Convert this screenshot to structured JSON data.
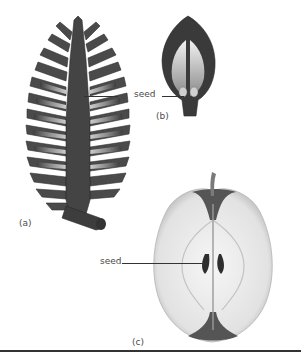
{
  "figure": {
    "panels": [
      {
        "id": "a",
        "label": "(a)",
        "subject": "pine-cone-section"
      },
      {
        "id": "b",
        "label": "(b)",
        "subject": "flower-ovary-section"
      },
      {
        "id": "c",
        "label": "(c)",
        "subject": "apple-cross-section"
      }
    ],
    "annotations": {
      "seed_ab": "seed",
      "seed_c": "seed"
    },
    "colors": {
      "dark_tissue": "#3a3a3a",
      "mid_tissue": "#8a8a8a",
      "light_tissue": "#e8e8e8",
      "leader_line": "#333333"
    }
  }
}
